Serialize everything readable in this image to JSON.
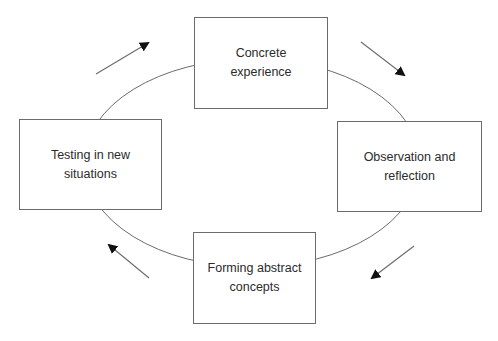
{
  "diagram": {
    "type": "cycle",
    "title": "",
    "nodes": [
      {
        "id": "concrete",
        "label": "Concrete\nexperience"
      },
      {
        "id": "observation",
        "label": "Observation and\nreflection"
      },
      {
        "id": "abstract",
        "label": "Forming abstract\nconcepts"
      },
      {
        "id": "testing",
        "label": "Testing in new\nsituations"
      }
    ],
    "flow_direction": "clockwise",
    "edges": [
      {
        "from": "concrete",
        "to": "observation"
      },
      {
        "from": "observation",
        "to": "abstract"
      },
      {
        "from": "abstract",
        "to": "testing"
      },
      {
        "from": "testing",
        "to": "concrete"
      }
    ],
    "colors": {
      "line": "#6b6b6b",
      "arrowhead": "#111111",
      "text": "#2b2b2b",
      "background": "#ffffff"
    }
  }
}
